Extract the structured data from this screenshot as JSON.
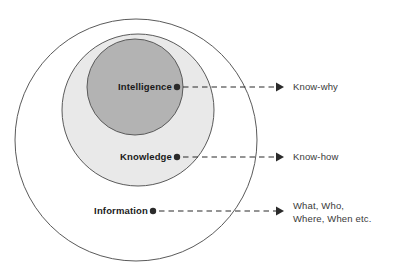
{
  "diagram": {
    "type": "concentric-venn",
    "colors": {
      "outer_fill": "#ffffff",
      "middle_fill": "#e9e9e9",
      "inner_fill": "#b3b3b3",
      "stroke": "#5a5a5a",
      "label_text": "#1a1a1a",
      "outcome_text": "#3a3a3a",
      "connector": "#2b2b2b",
      "background": "#ffffff"
    },
    "rings": [
      {
        "id": "information",
        "label": "Information",
        "level": 1,
        "fill": "#ffffff",
        "cx": 136,
        "cy": 140,
        "r": 121,
        "label_x": 148,
        "label_y": 214,
        "dot_x": 153,
        "dot_y": 211,
        "arrow_end_x": 283
      },
      {
        "id": "knowledge",
        "label": "Knowledge",
        "level": 2,
        "fill": "#e9e9e9",
        "cx": 138,
        "cy": 110,
        "r": 76,
        "label_x": 172,
        "label_y": 160,
        "dot_x": 177,
        "dot_y": 157,
        "arrow_end_x": 283
      },
      {
        "id": "intelligence",
        "label": "Intelligence",
        "level": 3,
        "fill": "#b3b3b3",
        "cx": 135,
        "cy": 87,
        "r": 48,
        "label_x": 172,
        "label_y": 90,
        "dot_x": 177,
        "dot_y": 87,
        "arrow_end_x": 283
      }
    ],
    "outcomes": [
      {
        "id": "know-why",
        "for_ring": "intelligence",
        "lines": [
          "Know-why"
        ],
        "x": 293,
        "y": 90
      },
      {
        "id": "know-how",
        "for_ring": "knowledge",
        "lines": [
          "Know-how"
        ],
        "x": 293,
        "y": 160
      },
      {
        "id": "what-who-where-when",
        "for_ring": "information",
        "lines": [
          "What, Who,",
          "Where, When etc."
        ],
        "x": 293,
        "y": 209
      }
    ]
  }
}
